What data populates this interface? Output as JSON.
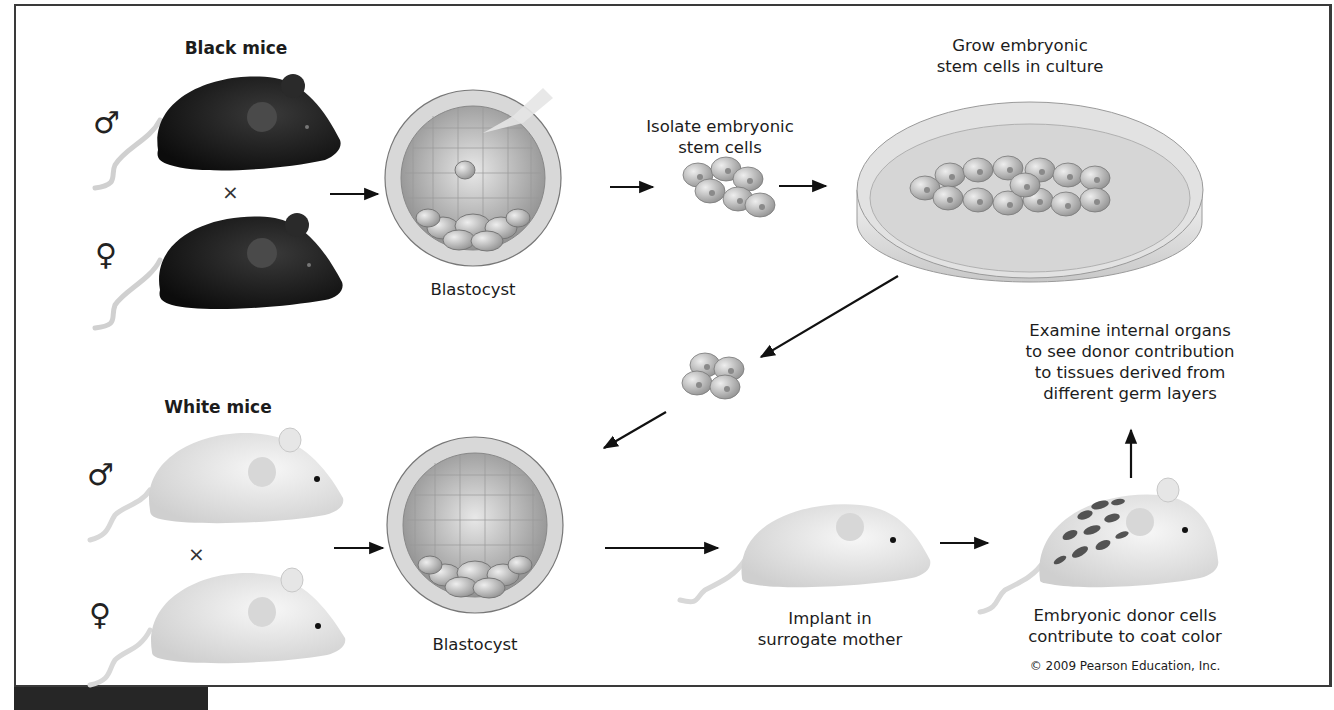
{
  "labels": {
    "black_mice": "Black mice",
    "white_mice": "White mice",
    "blastocyst_top": "Blastocyst",
    "blastocyst_bottom": "Blastocyst",
    "isolate": "Isolate embryonic\nstem cells",
    "grow": "Grow embryonic\nstem cells in culture",
    "implant": "Implant in\nsurrogate mother",
    "donor": "Embryonic donor cells\ncontribute to coat color",
    "examine": "Examine internal organs\nto see donor contribution\nto tissues derived from\ndifferent germ layers",
    "copyright": "© 2009 Pearson Education, Inc."
  },
  "symbols": {
    "male": "♂",
    "female": "♀",
    "cross": "×"
  },
  "colors": {
    "black_mouse": "#151515",
    "white_mouse": "#e4e4e4",
    "cell": "#b9b9b9",
    "arrow": "#111111",
    "border": "#3a3a3a"
  }
}
